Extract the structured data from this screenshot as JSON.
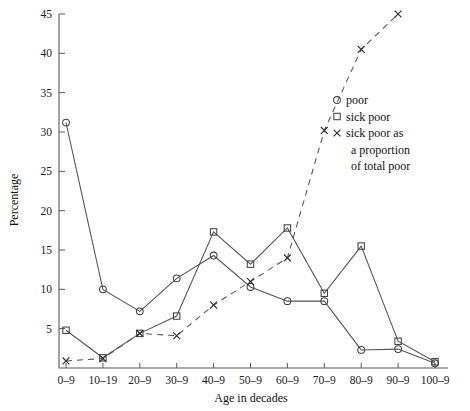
{
  "chart_data": {
    "type": "line",
    "title": "",
    "xlabel": "Age in decades",
    "ylabel": "Percentage",
    "categories": [
      "0–9",
      "10–19",
      "20–9",
      "30–9",
      "40–9",
      "50–9",
      "60–9",
      "70–9",
      "80–9",
      "90–9",
      "100–9"
    ],
    "ylim": [
      0,
      45
    ],
    "xlim_categories": 11,
    "ytick_labels": [
      "0",
      "5",
      "10",
      "15",
      "20",
      "25",
      "30",
      "35",
      "40",
      "45"
    ],
    "ytick_values": [
      0,
      5,
      10,
      15,
      20,
      25,
      30,
      35,
      40,
      45
    ],
    "ytick_visible": [
      "5",
      "10",
      "15",
      "20",
      "25",
      "30",
      "35",
      "40",
      "45"
    ],
    "grid": false,
    "legend_position": "upper right inside",
    "series": [
      {
        "name": "poor",
        "marker": "circle",
        "linestyle": "solid",
        "values": [
          31.2,
          10.0,
          7.2,
          11.4,
          14.3,
          10.3,
          8.5,
          8.5,
          2.3,
          2.4,
          0.6
        ]
      },
      {
        "name": "sick poor",
        "marker": "square",
        "linestyle": "solid",
        "values": [
          4.8,
          1.3,
          4.4,
          6.6,
          17.3,
          13.2,
          17.8,
          9.5,
          15.5,
          3.4,
          0.8
        ]
      },
      {
        "name": "sick poor as a proportion of total poor",
        "marker": "x",
        "linestyle": "dashed",
        "values": [
          0.9,
          1.2,
          4.4,
          4.1,
          8.0,
          11.0,
          14.0,
          30.2,
          40.5,
          45.0,
          null
        ]
      }
    ]
  },
  "legend": {
    "entries": [
      {
        "marker": "circle",
        "label": "poor"
      },
      {
        "marker": "square",
        "label": "sick poor"
      },
      {
        "marker": "x",
        "label": "sick poor as"
      }
    ],
    "continuation_line_1": "a proportion",
    "continuation_line_2": "of total poor"
  },
  "colors": {
    "line": "#555555",
    "marker": "#444444",
    "axis": "#5a5a5a",
    "text": "#111111",
    "background": "#ffffff"
  }
}
